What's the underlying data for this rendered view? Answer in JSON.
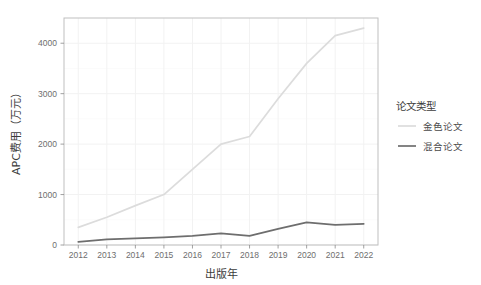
{
  "chart_data": {
    "type": "line",
    "title": "",
    "subtitle": "",
    "xlabel": "出版年",
    "ylabel": "APC费用（万元）",
    "x": [
      2012,
      2013,
      2014,
      2015,
      2016,
      2017,
      2018,
      2019,
      2020,
      2021,
      2022
    ],
    "xtick_labels": [
      "2012",
      "2013",
      "2014",
      "2015",
      "2016",
      "2017",
      "2018",
      "2019",
      "2020",
      "2021",
      "2022"
    ],
    "ytick_labels": [
      "0",
      "1000",
      "2000",
      "3000",
      "4000"
    ],
    "ytick_values": [
      0,
      1000,
      2000,
      3000,
      4000
    ],
    "xlim": [
      2011.5,
      2022.5
    ],
    "ylim": [
      0,
      4500
    ],
    "grid": true,
    "legend_position": "right",
    "series": [
      {
        "name": "金色论文",
        "color": "#dcdcdc",
        "values": [
          350,
          550,
          780,
          1000,
          1500,
          2000,
          2150,
          2900,
          3600,
          4150,
          4300
        ]
      },
      {
        "name": "混合论文",
        "color": "#6e6e6e",
        "values": [
          60,
          110,
          130,
          150,
          180,
          230,
          180,
          320,
          450,
          400,
          420
        ]
      }
    ]
  },
  "legend": {
    "title": "论文类型",
    "items": [
      {
        "label": "金色论文",
        "color": "#dcdcdc"
      },
      {
        "label": "混合论文",
        "color": "#6e6e6e"
      }
    ]
  },
  "axes": {
    "x_title": "出版年",
    "y_title": "APC费用（万元）"
  },
  "colors": {
    "background": "#ffffff",
    "panel_border": "#bfbfbf",
    "grid_major": "#f2f2f2",
    "text": "#4d4d4d",
    "gold_series": "#dcdcdc",
    "hybrid_series": "#6e6e6e"
  }
}
